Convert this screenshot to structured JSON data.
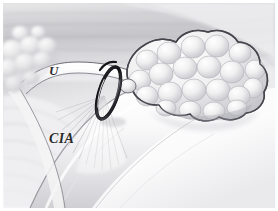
{
  "figure": {
    "kind": "anatomical-surgical-illustration",
    "width": 278,
    "height": 211,
    "background_color": "#f2f2f3",
    "border_color": "#ffffff",
    "outline_color": "#4a4a50",
    "palette": {
      "background_light": "#fbfbfb",
      "background_mid": "#e3e3e5",
      "background_dark": "#c9c9cd",
      "tissue_light": "#fdfdfd",
      "tissue_shadow": "#cfcfd4",
      "node_fill": "#f0f0f1",
      "node_shade": "#c4c4c9",
      "loop_dark": "#1c1c20",
      "label_color": "#2b2b2f"
    }
  },
  "labels": {
    "ureter": "U",
    "common_iliac_artery": "CIA"
  },
  "structures": {
    "ureter_band": "ureter crossing obliquely across mid field",
    "common_iliac_artery": "large pale vessel running lower-left to center",
    "left_node_cluster": "cluster of rounded lymph nodes upper left",
    "right_node_mass": "large lobulated nodal mass on the right",
    "vessel_loop": "dark elongated loop encircling vessel at center",
    "fan_fibers": "radiating fibrous strands below the loop",
    "background_bands": "horizontal striated soft-tissue planes"
  }
}
